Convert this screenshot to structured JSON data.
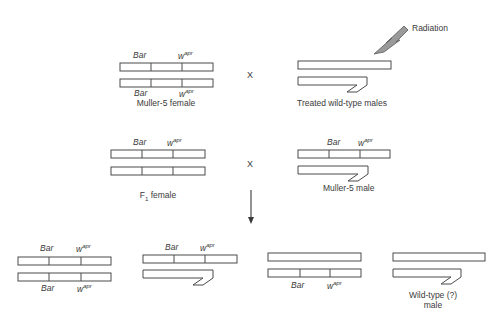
{
  "genes": {
    "bar": "Bar",
    "white_base": "w",
    "white_sup": "apr"
  },
  "cross_symbol": "X",
  "radiation_label": "Radiation",
  "labels": {
    "muller5_female": "Muller-5 female",
    "treated_males": "Treated wild-type males",
    "f1_female": "F",
    "f1_sub": "1",
    "f1_rest": " female",
    "muller5_male": "Muller-5 male",
    "wildtype_male_line1": "Wild-type (?)",
    "wildtype_male_line2": "male"
  }
}
